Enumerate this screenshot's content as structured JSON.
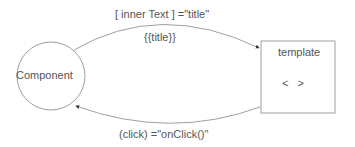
{
  "diagram": {
    "component_label": "Component",
    "template_label": "template",
    "template_content": "<   >",
    "top_arrow_label": "[ inner Text ] =\"title\"",
    "top_arrow_sublabel": "{{title}}",
    "bottom_arrow_label": "(click) =\"onClick()\"",
    "colors": {
      "stroke": "#888888",
      "text": "#555555",
      "background": "#ffffff"
    }
  }
}
